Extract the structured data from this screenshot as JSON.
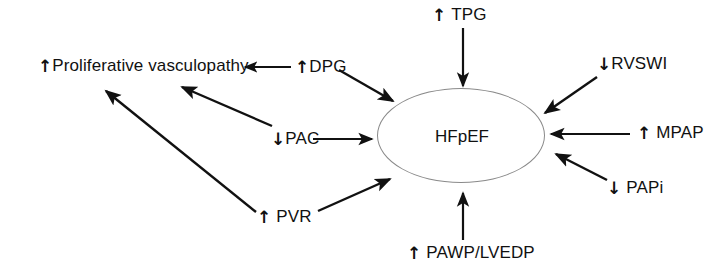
{
  "diagram": {
    "type": "concept-map",
    "center": {
      "id": "hfpef",
      "label": "HFpEF",
      "shape": "ellipse"
    },
    "nodes": [
      {
        "id": "proliferative-vasculopathy",
        "direction": "up",
        "arrow_glyph": "↑",
        "glyph_gap": false,
        "label": "Proliferative vasculopathy"
      },
      {
        "id": "dpg",
        "direction": "up",
        "arrow_glyph": "↑",
        "glyph_gap": false,
        "label": "DPG"
      },
      {
        "id": "tpg",
        "direction": "up",
        "arrow_glyph": "↑",
        "glyph_gap": true,
        "label": "TPG"
      },
      {
        "id": "rvswi",
        "direction": "down",
        "arrow_glyph": "↓",
        "glyph_gap": false,
        "label": "RVSWI"
      },
      {
        "id": "mpap",
        "direction": "up",
        "arrow_glyph": "↑",
        "glyph_gap": true,
        "label": "MPAP"
      },
      {
        "id": "papi",
        "direction": "down",
        "arrow_glyph": "↓",
        "glyph_gap": true,
        "label": "PAPi"
      },
      {
        "id": "pac",
        "direction": "down",
        "arrow_glyph": "↓",
        "glyph_gap": false,
        "label": "PAC"
      },
      {
        "id": "pvr",
        "direction": "up",
        "arrow_glyph": "↑",
        "glyph_gap": true,
        "label": "PVR"
      },
      {
        "id": "pawp-lvedp",
        "direction": "up",
        "arrow_glyph": "↑",
        "glyph_gap": true,
        "label": "PAWP/LVEDP"
      }
    ],
    "edges": [
      {
        "from": "dpg",
        "to": "proliferative-vasculopathy"
      },
      {
        "from": "dpg",
        "to": "hfpef"
      },
      {
        "from": "tpg",
        "to": "hfpef"
      },
      {
        "from": "rvswi",
        "to": "hfpef"
      },
      {
        "from": "mpap",
        "to": "hfpef"
      },
      {
        "from": "papi",
        "to": "hfpef"
      },
      {
        "from": "pac",
        "to": "hfpef"
      },
      {
        "from": "pac",
        "to": "proliferative-vasculopathy"
      },
      {
        "from": "pvr",
        "to": "hfpef"
      },
      {
        "from": "pvr",
        "to": "proliferative-vasculopathy"
      },
      {
        "from": "pawp-lvedp",
        "to": "hfpef"
      }
    ],
    "colors": {
      "stroke": "#111111",
      "ellipse_stroke": "#8a8a8a",
      "background": "#ffffff",
      "text": "#111111"
    }
  }
}
